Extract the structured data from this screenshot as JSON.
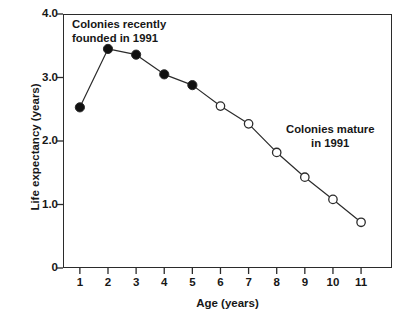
{
  "chart_data": {
    "type": "line",
    "title": "",
    "xlabel": "Age (years)",
    "ylabel": "Life expectancy (years)",
    "xlim": [
      0.4,
      12.1
    ],
    "ylim": [
      0,
      4.0
    ],
    "grid": false,
    "legend_position": "none",
    "x_tick_labels": [
      "1",
      "2",
      "3",
      "4",
      "5",
      "6",
      "7",
      "8",
      "9",
      "10",
      "11"
    ],
    "x_tick_values": [
      1,
      2,
      3,
      4,
      5,
      6,
      7,
      8,
      9,
      10,
      11
    ],
    "y_tick_labels": [
      "4.0",
      "3.0",
      "2.0",
      "1.0",
      "0"
    ],
    "y_tick_values": [
      4.0,
      3.0,
      2.0,
      1.0,
      0
    ],
    "x": [
      1,
      2,
      3,
      4,
      5,
      6,
      7,
      8,
      9,
      10,
      11
    ],
    "values": [
      2.53,
      3.45,
      3.36,
      3.05,
      2.88,
      2.55,
      2.27,
      1.82,
      1.43,
      1.08,
      0.72
    ],
    "series": [
      {
        "name": "Colonies recently founded in 1991",
        "marker": "filled-circle",
        "x": [
          1,
          2,
          3,
          4,
          5
        ],
        "values": [
          2.53,
          3.45,
          3.36,
          3.05,
          2.88
        ]
      },
      {
        "name": "Colonies mature in 1991",
        "marker": "open-circle",
        "x": [
          6,
          7,
          8,
          9,
          10,
          11
        ],
        "values": [
          2.55,
          2.27,
          1.82,
          1.43,
          1.08,
          0.72
        ]
      }
    ],
    "annotations": [
      {
        "id": "founded",
        "lines": [
          "Colonies recently",
          "founded in 1991"
        ],
        "x": 1.2,
        "y": 3.92
      },
      {
        "id": "mature",
        "lines": [
          "Colonies mature",
          "in 1991"
        ],
        "x": 8.9,
        "y": 2.32
      }
    ],
    "colors": {
      "line": "#2b2b2b",
      "marker_fill_filled": "#111111",
      "marker_fill_open": "#ffffff",
      "marker_edge": "#2b2b2b",
      "axis": "#2b2b2b",
      "text": "#171717",
      "background": "#ffffff"
    }
  }
}
